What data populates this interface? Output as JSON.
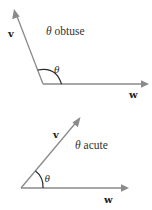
{
  "diagrams": {
    "obtuse": {
      "caption_symbol": "θ",
      "caption_text": " obtuse",
      "angle_label": "θ",
      "vector_v_label": "v",
      "vector_w_label": "w",
      "angle_type": "obtuse"
    },
    "acute": {
      "caption_symbol": "θ",
      "caption_text": " acute",
      "angle_label": "θ",
      "vector_v_label": "v",
      "vector_w_label": "w",
      "angle_type": "acute"
    }
  },
  "colors": {
    "vector": "#8a8a8a",
    "arc": "#2a2a2a",
    "text": "#333333",
    "background": "#ffffff"
  }
}
